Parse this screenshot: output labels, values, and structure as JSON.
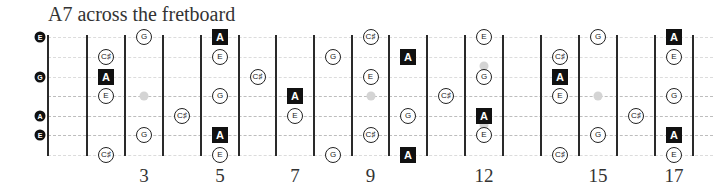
{
  "title": "A7 across the fretboard",
  "colors": {
    "root_fill": "#111111",
    "note_border": "#222222",
    "inlay": "#d4d4d4",
    "fret": "#2a2a2a"
  },
  "geometry": {
    "fret_lines_x": [
      48,
      87,
      125,
      163,
      201,
      239,
      276,
      314,
      352,
      389,
      427,
      465,
      503,
      541,
      579,
      617,
      655,
      693
    ],
    "rows_y": [
      37,
      57,
      77,
      96,
      116,
      135,
      155
    ],
    "strong_rows": [
      3,
      4,
      5
    ]
  },
  "string_labels": [
    {
      "label": "E",
      "row": 0
    },
    {
      "label": "G",
      "row": 2
    },
    {
      "label": "A",
      "row": 4
    },
    {
      "label": "E",
      "row": 5
    }
  ],
  "inlays": [
    {
      "fret": 3,
      "y": 96
    },
    {
      "fret": 9,
      "y": 96
    },
    {
      "fret": 12,
      "y": 66
    },
    {
      "fret": 12,
      "y": 125
    },
    {
      "fret": 15,
      "y": 96
    }
  ],
  "notes": [
    {
      "fret": 2,
      "row": 1,
      "label": "C♯",
      "root": false
    },
    {
      "fret": 2,
      "row": 2,
      "label": "A",
      "root": true
    },
    {
      "fret": 2,
      "row": 3,
      "label": "E",
      "root": false
    },
    {
      "fret": 2,
      "row": 6,
      "label": "C♯",
      "root": false
    },
    {
      "fret": 3,
      "row": 0,
      "label": "G",
      "root": false
    },
    {
      "fret": 3,
      "row": 5,
      "label": "G",
      "root": false
    },
    {
      "fret": 4,
      "row": 4,
      "label": "C♯",
      "root": false
    },
    {
      "fret": 5,
      "row": 0,
      "label": "A",
      "root": true
    },
    {
      "fret": 5,
      "row": 1,
      "label": "E",
      "root": false
    },
    {
      "fret": 5,
      "row": 3,
      "label": "G",
      "root": false
    },
    {
      "fret": 5,
      "row": 5,
      "label": "A",
      "root": true
    },
    {
      "fret": 5,
      "row": 6,
      "label": "E",
      "root": false
    },
    {
      "fret": 6,
      "row": 2,
      "label": "C♯",
      "root": false
    },
    {
      "fret": 7,
      "row": 3,
      "label": "A",
      "root": true
    },
    {
      "fret": 7,
      "row": 4,
      "label": "E",
      "root": false
    },
    {
      "fret": 8,
      "row": 1,
      "label": "G",
      "root": false
    },
    {
      "fret": 8,
      "row": 6,
      "label": "G",
      "root": false
    },
    {
      "fret": 9,
      "row": 0,
      "label": "C♯",
      "root": false
    },
    {
      "fret": 9,
      "row": 2,
      "label": "E",
      "root": false
    },
    {
      "fret": 9,
      "row": 5,
      "label": "C♯",
      "root": false
    },
    {
      "fret": 10,
      "row": 1,
      "label": "A",
      "root": true
    },
    {
      "fret": 10,
      "row": 4,
      "label": "G",
      "root": false
    },
    {
      "fret": 10,
      "row": 6,
      "label": "A",
      "root": true
    },
    {
      "fret": 11,
      "row": 3,
      "label": "C♯",
      "root": false
    },
    {
      "fret": 12,
      "row": 0,
      "label": "E",
      "root": false
    },
    {
      "fret": 12,
      "row": 2,
      "label": "G",
      "root": false
    },
    {
      "fret": 12,
      "row": 4,
      "label": "A",
      "root": true
    },
    {
      "fret": 12,
      "row": 5,
      "label": "E",
      "root": false
    },
    {
      "fret": 14,
      "row": 1,
      "label": "C♯",
      "root": false
    },
    {
      "fret": 14,
      "row": 2,
      "label": "A",
      "root": true
    },
    {
      "fret": 14,
      "row": 3,
      "label": "E",
      "root": false
    },
    {
      "fret": 14,
      "row": 6,
      "label": "C♯",
      "root": false
    },
    {
      "fret": 15,
      "row": 0,
      "label": "G",
      "root": false
    },
    {
      "fret": 15,
      "row": 5,
      "label": "G",
      "root": false
    },
    {
      "fret": 16,
      "row": 4,
      "label": "C♯",
      "root": false
    },
    {
      "fret": 17,
      "row": 0,
      "label": "A",
      "root": true
    },
    {
      "fret": 17,
      "row": 1,
      "label": "E",
      "root": false
    },
    {
      "fret": 17,
      "row": 3,
      "label": "G",
      "root": false
    },
    {
      "fret": 17,
      "row": 5,
      "label": "A",
      "root": true
    },
    {
      "fret": 17,
      "row": 6,
      "label": "E",
      "root": false
    }
  ],
  "fret_numbers": [
    {
      "label": "3",
      "fret": 3
    },
    {
      "label": "5",
      "fret": 5
    },
    {
      "label": "7",
      "fret": 7
    },
    {
      "label": "9",
      "fret": 9
    },
    {
      "label": "12",
      "fret": 12
    },
    {
      "label": "15",
      "fret": 15
    },
    {
      "label": "17",
      "fret": 17
    }
  ]
}
